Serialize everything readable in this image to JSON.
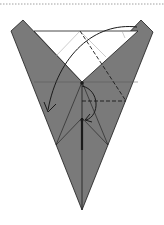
{
  "diagram": {
    "type": "origami-fold-step",
    "colors": {
      "paper_colored": "#7a7a7a",
      "paper_white": "#ffffff",
      "line": "#1a1a1a",
      "guide_line": "#9a9a9a",
      "top_border": "#a0a0a0"
    },
    "elements": [
      {
        "name": "top-dotted-border",
        "kind": "dotted line"
      },
      {
        "name": "left-flap",
        "kind": "colored paper"
      },
      {
        "name": "right-flap",
        "kind": "colored paper"
      },
      {
        "name": "bottom-point",
        "kind": "colored paper"
      },
      {
        "name": "white-triangle",
        "kind": "exposed white paper"
      },
      {
        "name": "valley-fold-line-diagonal",
        "kind": "dashed line"
      },
      {
        "name": "valley-fold-line-horizontal",
        "kind": "dashed line"
      },
      {
        "name": "fold-arrow-large",
        "kind": "curved arrow"
      },
      {
        "name": "fold-arrow-small",
        "kind": "curved arrow"
      }
    ]
  }
}
